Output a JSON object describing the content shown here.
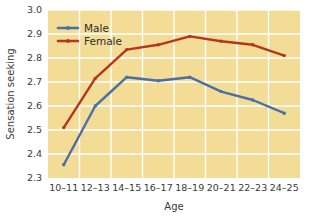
{
  "chart_data": {
    "type": "line",
    "title": "",
    "xlabel": "Age",
    "ylabel": "Sensation seeking",
    "categories": [
      "10–11",
      "12–13",
      "14–15",
      "16–17",
      "18–19",
      "20–21",
      "22–23",
      "24–25"
    ],
    "ylim": [
      2.3,
      3.0
    ],
    "yticks": [
      "2.3",
      "2.4",
      "2.5",
      "2.6",
      "2.7",
      "2.8",
      "2.9",
      "3.0"
    ],
    "ytick_values": [
      2.3,
      2.4,
      2.5,
      2.6,
      2.7,
      2.8,
      2.9,
      3.0
    ],
    "grid": true,
    "legend_position": "top-left",
    "series": [
      {
        "name": "Male",
        "color": "#4a6fa5",
        "values": [
          2.355,
          2.6,
          2.72,
          2.705,
          2.72,
          2.66,
          2.625,
          2.57
        ]
      },
      {
        "name": "Female",
        "color": "#b5361c",
        "values": [
          2.51,
          2.715,
          2.835,
          2.855,
          2.89,
          2.87,
          2.855,
          2.81
        ]
      }
    ],
    "plot_background": "#f2dc96",
    "gridline_color": "#ffffff",
    "figure_background": "#ffffff"
  }
}
